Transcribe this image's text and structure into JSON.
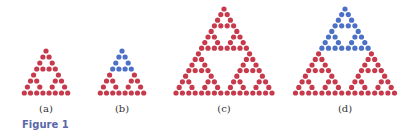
{
  "figure": {
    "caption": "Figure 1",
    "colors": {
      "red": "#c63a4c",
      "blue": "#4c70c6",
      "label": "#333333",
      "caption": "#5a67a8"
    },
    "panels": [
      {
        "id": "a",
        "label": "(a)",
        "rows": 8,
        "blue_rows": 0,
        "apex": [
          46,
          51
        ],
        "dx": 6.2,
        "dy": 6.0,
        "r": 2.6,
        "label_x": 46,
        "label_y": 103
      },
      {
        "id": "b",
        "label": "(b)",
        "rows": 8,
        "blue_rows": 4,
        "apex": [
          122,
          51
        ],
        "dx": 6.2,
        "dy": 6.0,
        "r": 2.6,
        "label_x": 122,
        "label_y": 103
      },
      {
        "id": "c",
        "label": "(c)",
        "rows": 16,
        "blue_rows": 0,
        "apex": [
          224,
          9
        ],
        "dx": 6.4,
        "dy": 5.6,
        "r": 2.6,
        "label_x": 224,
        "label_y": 103
      },
      {
        "id": "d",
        "label": "(d)",
        "rows": 16,
        "blue_rows": 8,
        "apex": [
          345,
          9
        ],
        "dx": 6.6,
        "dy": 5.6,
        "r": 2.6,
        "label_x": 345,
        "label_y": 103
      }
    ]
  }
}
